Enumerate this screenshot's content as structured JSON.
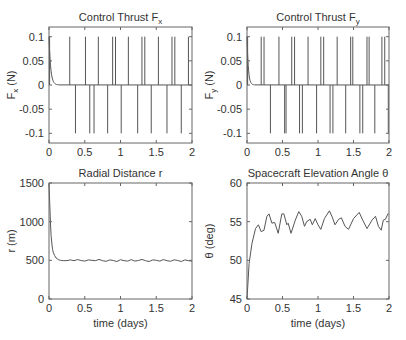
{
  "figure": {
    "background": "#ffffff",
    "line_color": "#555555",
    "axis_color": "#666666"
  },
  "chart_data": [
    {
      "id": "fx",
      "type": "line",
      "title": "Control Thrust F",
      "title_subscript": "x",
      "xlabel": "",
      "ylabel": "F",
      "ylabel_subscript": "x",
      "ylabel_unit": " (N)",
      "xlim": [
        0,
        2
      ],
      "ylim": [
        -0.12,
        0.12
      ],
      "xticks": [
        0,
        0.5,
        1,
        1.5,
        2
      ],
      "xtick_labels": [
        "0",
        "0.5",
        "1",
        "1.5",
        "2"
      ],
      "yticks": [
        -0.1,
        -0.05,
        0,
        0.05,
        0.1
      ],
      "ytick_labels": [
        "-0.1",
        "-0.05",
        "0",
        "0.05",
        "0.1"
      ],
      "grid": false,
      "box": [
        49,
        27,
        192,
        143
      ],
      "initial_decay": {
        "from": 0.1,
        "t_end": 0.14
      },
      "pulses_positive": [
        0.29,
        0.51,
        0.69,
        0.89,
        0.93,
        1.11,
        1.3,
        1.34,
        1.53,
        1.72,
        1.76,
        1.95
      ],
      "pulses_negative": [
        0.37,
        0.57,
        0.63,
        0.82,
        1.01,
        1.24,
        1.43,
        1.65,
        1.85
      ],
      "pulse_magnitude": 0.1
    },
    {
      "id": "fy",
      "type": "line",
      "title": "Control Thrust F",
      "title_subscript": "y",
      "xlabel": "",
      "ylabel": "F",
      "ylabel_subscript": "y",
      "ylabel_unit": " (N)",
      "xlim": [
        0,
        2
      ],
      "ylim": [
        -0.12,
        0.12
      ],
      "xticks": [
        0,
        0.5,
        1,
        1.5,
        2
      ],
      "xtick_labels": [
        "0",
        "0.5",
        "1",
        "1.5",
        "2"
      ],
      "yticks": [
        -0.1,
        -0.05,
        0,
        0.05,
        0.1
      ],
      "ytick_labels": [
        "-0.1",
        "-0.05",
        "0",
        "0.05",
        "0.1"
      ],
      "grid": false,
      "box": [
        247,
        27,
        389,
        143
      ],
      "initial_decay": {
        "from": 0.1,
        "t_end": 0.11
      },
      "pulses_positive": [
        0.2,
        0.24,
        0.45,
        0.63,
        0.67,
        0.86,
        1.04,
        1.08,
        1.27,
        1.46,
        1.49,
        1.69,
        1.72,
        1.9,
        1.94
      ],
      "pulses_negative": [
        0.33,
        0.53,
        0.55,
        0.74,
        0.78,
        0.98,
        1.17,
        1.21,
        1.39,
        1.59,
        1.63,
        1.8,
        1.99
      ],
      "pulse_magnitude": 0.1
    },
    {
      "id": "r",
      "type": "line",
      "title": "Radial Distance r",
      "title_subscript": "",
      "xlabel": "time (days)",
      "ylabel": "r",
      "ylabel_subscript": "",
      "ylabel_unit": " (m)",
      "xlim": [
        0,
        2
      ],
      "ylim": [
        0,
        1500
      ],
      "xticks": [
        0,
        0.5,
        1,
        1.5,
        2
      ],
      "xtick_labels": [
        "0",
        "0.5",
        "1",
        "1.5",
        "2"
      ],
      "yticks": [
        0,
        500,
        1000,
        1500
      ],
      "ytick_labels": [
        "0",
        "500",
        "1000",
        "1500"
      ],
      "grid": false,
      "box": [
        49,
        183,
        192,
        299
      ],
      "x": [
        0,
        0.01,
        0.02,
        0.03,
        0.04,
        0.05,
        0.06,
        0.08,
        0.1,
        0.13,
        0.16,
        0.2,
        0.25,
        0.3,
        0.35,
        0.4,
        0.45,
        0.5,
        0.55,
        0.6,
        0.65,
        0.7,
        0.75,
        0.8,
        0.85,
        0.9,
        0.95,
        1.0,
        1.05,
        1.1,
        1.15,
        1.2,
        1.25,
        1.3,
        1.35,
        1.4,
        1.45,
        1.5,
        1.55,
        1.6,
        1.65,
        1.7,
        1.75,
        1.8,
        1.85,
        1.9,
        1.95,
        2.0
      ],
      "y": [
        1480,
        1250,
        1000,
        820,
        710,
        640,
        600,
        560,
        530,
        510,
        500,
        495,
        497,
        505,
        495,
        510,
        498,
        490,
        505,
        500,
        495,
        512,
        495,
        488,
        505,
        498,
        485,
        508,
        495,
        490,
        510,
        490,
        498,
        512,
        495,
        485,
        505,
        500,
        490,
        510,
        495,
        488,
        507,
        498,
        485,
        505,
        495,
        490
      ]
    },
    {
      "id": "theta",
      "type": "line",
      "title": "Spacecraft Elevation Angle θ",
      "title_subscript": "",
      "xlabel": "time (days)",
      "ylabel": "θ",
      "ylabel_subscript": "",
      "ylabel_unit": " (deg)",
      "xlim": [
        0,
        2
      ],
      "ylim": [
        45,
        60
      ],
      "xticks": [
        0,
        0.5,
        1,
        1.5,
        2
      ],
      "xtick_labels": [
        "0",
        "0.5",
        "1",
        "1.5",
        "2"
      ],
      "yticks": [
        45,
        50,
        55,
        60
      ],
      "ytick_labels": [
        "45",
        "50",
        "55",
        "60"
      ],
      "grid": false,
      "box": [
        247,
        183,
        389,
        299
      ],
      "x": [
        0,
        0.03,
        0.07,
        0.12,
        0.16,
        0.2,
        0.24,
        0.28,
        0.31,
        0.35,
        0.39,
        0.44,
        0.49,
        0.52,
        0.56,
        0.58,
        0.62,
        0.68,
        0.73,
        0.77,
        0.81,
        0.84,
        0.89,
        0.92,
        0.96,
        1.0,
        1.04,
        1.09,
        1.16,
        1.2,
        1.24,
        1.29,
        1.33,
        1.38,
        1.43,
        1.5,
        1.58,
        1.63,
        1.69,
        1.76,
        1.81,
        1.85,
        1.89,
        1.92,
        1.95,
        1.99
      ],
      "y": [
        45,
        49.6,
        52.2,
        54.1,
        54.6,
        53.7,
        53.9,
        55.7,
        56.0,
        54.8,
        54.9,
        53.5,
        56.0,
        56.0,
        54.6,
        54.8,
        53.5,
        55.2,
        56.3,
        55.7,
        54.4,
        55.0,
        55.3,
        54.6,
        55.4,
        54.6,
        54.0,
        55.4,
        56.4,
        55.6,
        54.6,
        55.3,
        55.5,
        54.4,
        54.0,
        55.4,
        56.2,
        55.2,
        54.1,
        55.2,
        55.7,
        54.4,
        53.9,
        55.2,
        55.3,
        56.1
      ]
    }
  ]
}
